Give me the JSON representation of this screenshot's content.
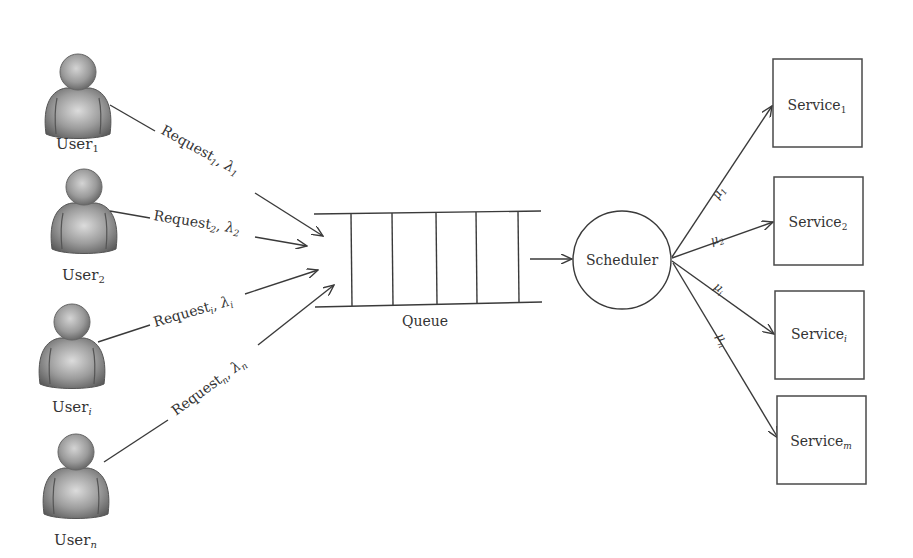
{
  "diagram": {
    "type": "queueing-system",
    "colors": {
      "line": "#3a3a3a",
      "text": "#333333",
      "user_icon": "#8c8c8c",
      "background": "#ffffff"
    },
    "users": [
      {
        "id": "user_1",
        "name": "User",
        "sub": "1",
        "request_label": "Request",
        "request_sub": "1",
        "rate": "λ",
        "rate_sub": "1"
      },
      {
        "id": "user_2",
        "name": "User",
        "sub": "2",
        "request_label": "Request",
        "request_sub": "2",
        "rate": "λ",
        "rate_sub": "2"
      },
      {
        "id": "user_i",
        "name": "User",
        "sub": "i",
        "request_label": "Request",
        "request_sub": "i",
        "rate": "λ",
        "rate_sub": "i"
      },
      {
        "id": "user_n",
        "name": "User",
        "sub": "n",
        "request_label": "Request",
        "request_sub": "n",
        "rate": "λ",
        "rate_sub": "n"
      }
    ],
    "queue": {
      "label": "Queue",
      "slots": 5
    },
    "scheduler": {
      "label": "Scheduler"
    },
    "services": [
      {
        "id": "service_1",
        "name": "Service",
        "sub": "1",
        "rate": "μ",
        "rate_sub": "1"
      },
      {
        "id": "service_2",
        "name": "Service",
        "sub": "2",
        "rate": "μ",
        "rate_sub": "2"
      },
      {
        "id": "service_i",
        "name": "Service",
        "sub": "i",
        "rate": "μ",
        "rate_sub": "i"
      },
      {
        "id": "service_m",
        "name": "Service",
        "sub": "m",
        "rate": "μ",
        "rate_sub": "n"
      }
    ]
  }
}
